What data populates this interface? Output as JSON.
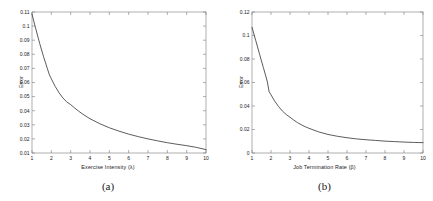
{
  "figure": {
    "background": "#ffffff",
    "axis_color": "#7a7a7a",
    "curve_color": "#3f3f3f"
  },
  "panels": [
    {
      "caption": "(a)",
      "ylabel": "Error",
      "xlabel": "Exercise Intensity (λ)"
    },
    {
      "caption": "(b)",
      "ylabel": "Error",
      "xlabel": "Job Termination Rate (β)"
    }
  ],
  "chart_data": [
    {
      "type": "line",
      "title": "",
      "caption": "(a)",
      "xlabel": "Exercise Intensity (λ)",
      "ylabel": "Error",
      "xlim": [
        1,
        10
      ],
      "ylim": [
        0.01,
        0.11
      ],
      "xticks": [
        1,
        2,
        3,
        4,
        5,
        6,
        7,
        8,
        9,
        10
      ],
      "xticklabels": [
        "1",
        "2",
        "3",
        "4",
        "5",
        "6",
        "7",
        "8",
        "9",
        "10"
      ],
      "yticks": [
        0.01,
        0.02,
        0.03,
        0.04,
        0.05,
        0.06,
        0.07,
        0.08,
        0.09,
        0.1,
        0.11
      ],
      "yticklabels": [
        "0.01",
        "0.02",
        "0.03",
        "0.04",
        "0.05",
        "0.06",
        "0.07",
        "0.08",
        "0.09",
        "0.1",
        "0.11"
      ],
      "grid": false,
      "legend": null,
      "x": [
        1.0,
        1.2,
        1.4,
        1.6,
        1.8,
        1.9,
        2.0,
        2.2,
        2.4,
        2.6,
        2.8,
        3.0,
        3.2,
        3.4,
        3.6,
        3.8,
        4.0,
        4.5,
        5.0,
        5.5,
        6.0,
        6.5,
        7.0,
        7.5,
        8.0,
        8.5,
        9.0,
        9.5,
        10.0
      ],
      "y": [
        0.1085,
        0.0978,
        0.0876,
        0.0782,
        0.0696,
        0.0655,
        0.0626,
        0.0572,
        0.0527,
        0.049,
        0.0462,
        0.0443,
        0.042,
        0.0398,
        0.0378,
        0.036,
        0.0343,
        0.0308,
        0.0279,
        0.0255,
        0.0234,
        0.0216,
        0.02,
        0.0186,
        0.0173,
        0.0162,
        0.0152,
        0.014,
        0.0124
      ]
    },
    {
      "type": "line",
      "title": "",
      "caption": "(b)",
      "xlabel": "Job Termination Rate (β)",
      "ylabel": "Error",
      "xlim": [
        1,
        10
      ],
      "ylim": [
        0,
        0.12
      ],
      "xticks": [
        1,
        2,
        3,
        4,
        5,
        6,
        7,
        8,
        9,
        10
      ],
      "xticklabels": [
        "1",
        "2",
        "3",
        "4",
        "5",
        "6",
        "7",
        "8",
        "9",
        "10"
      ],
      "yticks": [
        0,
        0.02,
        0.04,
        0.06,
        0.08,
        0.1,
        0.12
      ],
      "yticklabels": [
        "0",
        "0.02",
        "0.04",
        "0.06",
        "0.08",
        "0.1",
        "0.12"
      ],
      "grid": false,
      "legend": null,
      "x": [
        1.0,
        1.2,
        1.4,
        1.6,
        1.8,
        1.9,
        2.0,
        2.2,
        2.4,
        2.6,
        2.8,
        3.0,
        3.2,
        3.4,
        3.6,
        3.8,
        4.0,
        4.5,
        5.0,
        5.5,
        6.0,
        6.5,
        7.0,
        7.5,
        8.0,
        8.5,
        9.0,
        9.5,
        10.0
      ],
      "y": [
        0.107,
        0.0955,
        0.084,
        0.0726,
        0.0612,
        0.0522,
        0.0495,
        0.044,
        0.0395,
        0.0357,
        0.0328,
        0.0304,
        0.028,
        0.0258,
        0.024,
        0.0224,
        0.021,
        0.018,
        0.0158,
        0.0142,
        0.013,
        0.012,
        0.0113,
        0.0107,
        0.0101,
        0.0097,
        0.0093,
        0.009,
        0.0088
      ]
    }
  ]
}
